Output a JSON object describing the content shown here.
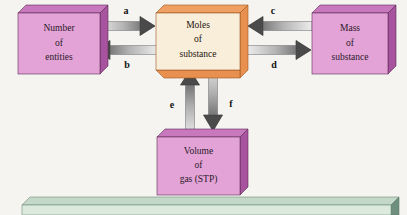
{
  "diagram": {
    "background_color": "#f6f4f1",
    "boxes": [
      {
        "id": "number-of-entities",
        "lines": [
          "Number",
          "of",
          "entities"
        ],
        "face_color": "#e3a3d6",
        "side_color": "#a8539e",
        "top_color": "#c878bd"
      },
      {
        "id": "moles-of-substance",
        "lines": [
          "Moles",
          "of",
          "substance"
        ],
        "face_color": "#f8eed9",
        "side_color": "#e8904f",
        "top_color": "#ef9f62"
      },
      {
        "id": "mass-of-substance",
        "lines": [
          "Mass",
          "of",
          "substance"
        ],
        "face_color": "#e3a3d6",
        "side_color": "#a8539e",
        "top_color": "#c878bd"
      },
      {
        "id": "volume-of-gas-stp",
        "lines": [
          "Volume",
          "of",
          "gas (STP)"
        ],
        "face_color": "#e3a3d6",
        "side_color": "#a8539e",
        "top_color": "#c878bd"
      }
    ],
    "arrows": [
      {
        "id": "arrow-a",
        "label": "a",
        "from": "number-of-entities",
        "to": "moles-of-substance",
        "direction": "right"
      },
      {
        "id": "arrow-b",
        "label": "b",
        "from": "moles-of-substance",
        "to": "number-of-entities",
        "direction": "left"
      },
      {
        "id": "arrow-c",
        "label": "c",
        "from": "mass-of-substance",
        "to": "moles-of-substance",
        "direction": "left"
      },
      {
        "id": "arrow-d",
        "label": "d",
        "from": "moles-of-substance",
        "to": "mass-of-substance",
        "direction": "right"
      },
      {
        "id": "arrow-e",
        "label": "e",
        "from": "volume-of-gas-stp",
        "to": "moles-of-substance",
        "direction": "up"
      },
      {
        "id": "arrow-f",
        "label": "f",
        "from": "moles-of-substance",
        "to": "volume-of-gas-stp",
        "direction": "down"
      }
    ],
    "footer_bar": {
      "id": "footer-bar",
      "face_color": "#dce9dd",
      "side_color": "#6f8f7d",
      "top_color": "#c3d8c6",
      "text": ""
    },
    "arrow_colors": {
      "gradient_light": "#e2e2e2",
      "gradient_dark": "#4a4a4a",
      "head_dark": "#454545"
    }
  }
}
